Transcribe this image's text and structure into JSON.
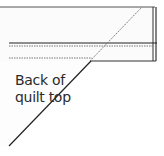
{
  "diagram": {
    "label_line1": "Back of",
    "label_line2": "quilt top",
    "colors": {
      "line": "#222222",
      "dotted": "#777777",
      "strip_fill": "#fafafa"
    }
  }
}
